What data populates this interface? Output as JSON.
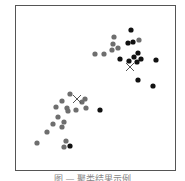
{
  "chart_data": {
    "type": "scatter",
    "title": "",
    "xlabel": "",
    "ylabel": "",
    "grid": false,
    "legend": null,
    "colors": {
      "cluster_gray": "#6e6e6e",
      "cluster_black": "#111111",
      "centroid": "#555555"
    },
    "series": [
      {
        "name": "gray points",
        "color": "#6e6e6e",
        "points": [
          [
            114,
            37
          ],
          [
            113,
            44
          ],
          [
            118,
            48
          ],
          [
            112,
            50
          ],
          [
            95,
            54
          ],
          [
            104,
            54
          ],
          [
            139,
            40
          ],
          [
            70,
            94
          ],
          [
            62,
            101
          ],
          [
            56,
            107
          ],
          [
            67,
            108
          ],
          [
            68,
            111
          ],
          [
            76,
            110
          ],
          [
            82,
            102
          ],
          [
            85,
            99
          ],
          [
            86,
            108
          ],
          [
            58,
            117
          ],
          [
            64,
            122
          ],
          [
            53,
            124
          ],
          [
            62,
            127
          ],
          [
            47,
            132
          ],
          [
            37,
            143
          ],
          [
            66,
            141
          ],
          [
            64,
            147
          ]
        ]
      },
      {
        "name": "black points",
        "color": "#111111",
        "points": [
          [
            131,
            30
          ],
          [
            128,
            43
          ],
          [
            133,
            42
          ],
          [
            120,
            59
          ],
          [
            129,
            61
          ],
          [
            134,
            57
          ],
          [
            138,
            53
          ],
          [
            141,
            59
          ],
          [
            137,
            62
          ],
          [
            156,
            60
          ],
          [
            138,
            80
          ],
          [
            153,
            86
          ],
          [
            100,
            110
          ],
          [
            70,
            146
          ]
        ]
      },
      {
        "name": "centroids",
        "color": "#555555",
        "marker": "x",
        "points": [
          [
            130,
            67
          ],
          [
            77,
            99
          ]
        ]
      }
    ]
  },
  "caption": "图 — 聚类结果示例"
}
